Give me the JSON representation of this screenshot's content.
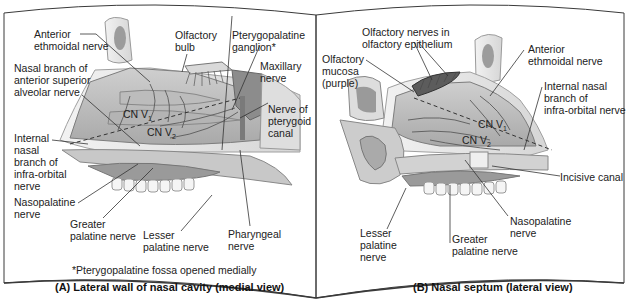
{
  "panels": [
    {
      "id": "A",
      "caption": "(A) Lateral wall of nasal cavity (medial view)",
      "footnote": "*Pterygopalatine fossa opened medially",
      "division_labels": {
        "v1": {
          "text": "CN V",
          "sub": "1"
        },
        "v2": {
          "text": "CN V",
          "sub": "2"
        }
      },
      "labels": [
        {
          "id": "anterior-ethmoidal-nerve",
          "text": "Anterior\nethmoidal nerve"
        },
        {
          "id": "nasal-branch-asa-nerve",
          "text": "Nasal branch of\nanterior superior\nalveolar nerve"
        },
        {
          "id": "internal-nasal-branch-infraorbital",
          "text": "Internal\nnasal\nbranch of\ninfra-orbital\nnerve"
        },
        {
          "id": "nasopalatine-nerve",
          "text": "Nasopalatine\nnerve"
        },
        {
          "id": "greater-palatine-nerve",
          "text": "Greater\npalatine nerve"
        },
        {
          "id": "lesser-palatine-nerve",
          "text": "Lesser\npalatine nerve"
        },
        {
          "id": "pharyngeal-nerve",
          "text": "Pharyngeal\nnerve"
        },
        {
          "id": "olfactory-bulb",
          "text": "Olfactory\nbulb"
        },
        {
          "id": "pterygopalatine-ganglion",
          "text": "Pterygopalatine\nganglion*"
        },
        {
          "id": "maxillary-nerve",
          "text": "Maxillary\nnerve"
        },
        {
          "id": "nerve-of-pterygoid-canal",
          "text": "Nerve of\npterygoid\ncanal"
        }
      ]
    },
    {
      "id": "B",
      "caption": "(B) Nasal septum (lateral view)",
      "division_labels": {
        "v1": {
          "text": "CN V",
          "sub": "1"
        },
        "v2": {
          "text": "CN V",
          "sub": "2"
        }
      },
      "labels": [
        {
          "id": "olfactory-nerves-epithelium",
          "text": "Olfactory nerves in\nolfactory epithelium"
        },
        {
          "id": "olfactory-mucosa",
          "text": "Olfactory\nmucosa\n(purple)"
        },
        {
          "id": "anterior-ethmoidal-nerve",
          "text": "Anterior\nethmoidal nerve"
        },
        {
          "id": "internal-nasal-branch-infraorbital",
          "text": "Internal nasal\nbranch of\ninfra-orbital nerve"
        },
        {
          "id": "incisive-canal",
          "text": "Incisive canal"
        },
        {
          "id": "nasopalatine-nerve",
          "text": "Nasopalatine\nnerve"
        },
        {
          "id": "greater-palatine-nerve",
          "text": "Greater\npalatine nerve"
        },
        {
          "id": "lesser-palatine-nerve",
          "text": "Lesser\npalatine\nnerve"
        }
      ]
    }
  ],
  "colors": {
    "frame": "#3a3a3a",
    "tissue_light": "#e6e6e6",
    "tissue_mid": "#bdbdbd",
    "tissue_dark": "#8a8a8a",
    "nerve": "#6b6b6b",
    "leader": "#333333"
  }
}
